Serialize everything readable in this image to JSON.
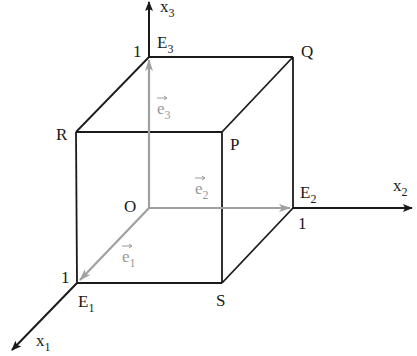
{
  "diagram": {
    "colors": {
      "edge": "#1a1a1a",
      "vector": "#a0a0a0",
      "text": "#1a1a1a"
    },
    "axes": [
      {
        "name": "x1",
        "base": "x",
        "sub": "1"
      },
      {
        "name": "x2",
        "base": "x",
        "sub": "2"
      },
      {
        "name": "x3",
        "base": "x",
        "sub": "3"
      }
    ],
    "points": {
      "O": "O",
      "R": "R",
      "P": "P",
      "Q": "Q",
      "S": "S",
      "E1": {
        "base": "E",
        "sub": "1"
      },
      "E2": {
        "base": "E",
        "sub": "2"
      },
      "E3": {
        "base": "E",
        "sub": "3"
      }
    },
    "unit_ticks": {
      "x1": "1",
      "x2": "1",
      "x3": "1"
    },
    "vectors": [
      {
        "base": "e",
        "sub": "1"
      },
      {
        "base": "e",
        "sub": "2"
      },
      {
        "base": "e",
        "sub": "3"
      }
    ]
  }
}
